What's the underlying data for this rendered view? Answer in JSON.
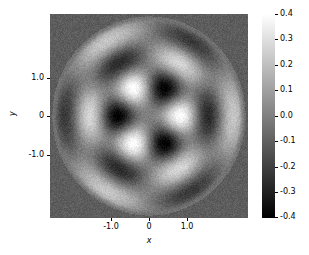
{
  "chart_data": {
    "type": "heatmap",
    "title": "",
    "xlabel": "x",
    "ylabel": "y",
    "xlim": [
      -2.1,
      2.1
    ],
    "ylim": [
      -2.1,
      2.1
    ],
    "xticks": [
      -1.0,
      0,
      1.0
    ],
    "xticklabels": [
      "-1.0",
      "0",
      "1.0"
    ],
    "yticks": [
      -1.0,
      0,
      1.0
    ],
    "yticklabels": [
      "-1.0",
      "0",
      "1.0"
    ],
    "grid": false,
    "colormap": "gray",
    "colorbar": {
      "vmin": -0.4,
      "vmax": 0.4,
      "orientation": "vertical",
      "position": "right",
      "ticks": [
        0.4,
        0.3,
        0.2,
        0.1,
        0.0,
        -0.1,
        -0.2,
        -0.3,
        -0.4
      ],
      "ticklabels": [
        "0.4",
        "0.3",
        "0.2",
        "0.1",
        "0.0",
        "-0.1",
        "-0.2",
        "-0.3",
        "-0.4"
      ]
    },
    "field": {
      "kind": "bessel_disk_mode",
      "azimuthal_order_m": 3,
      "angular_lobes": 6,
      "radial_nodes": 3,
      "disk_radius": 2.05,
      "amplitude": 0.4,
      "bessel_zero_kr": 13.0152,
      "outside_disk_value": -0.11,
      "noise_amplitude": 0.035
    }
  },
  "axes": {
    "x_tick_labels": [
      "-1.0",
      "0",
      "1.0"
    ],
    "y_tick_labels": [
      "1.0",
      "0",
      "-1.0"
    ],
    "x_axis_label": "x",
    "y_axis_label": "y"
  },
  "colorbar_labels": [
    "0.4",
    "0.3",
    "0.2",
    "0.1",
    "0.0",
    "-0.1",
    "-0.2",
    "-0.3",
    "-0.4"
  ]
}
